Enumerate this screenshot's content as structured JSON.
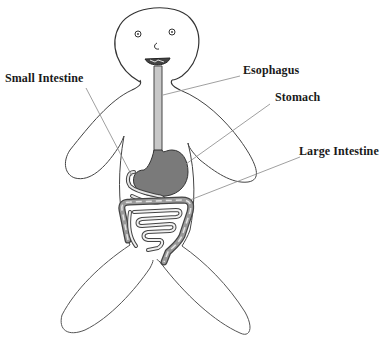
{
  "diagram": {
    "labels": [
      {
        "id": "small-intestine",
        "text": "Small Intestine"
      },
      {
        "id": "esophagus",
        "text": "Esophagus"
      },
      {
        "id": "stomach",
        "text": "Stomach"
      },
      {
        "id": "large-intestine",
        "text": "Large Intestine"
      }
    ],
    "colors": {
      "outline": "#333333",
      "organ_fill": "#7a7a7a",
      "organ_light": "#c8c8c8",
      "leader_line": "#888888"
    }
  }
}
